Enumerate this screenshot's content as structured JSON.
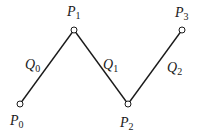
{
  "diagram": {
    "type": "polyline",
    "stroke_color": "#1a1a1a",
    "points": [
      {
        "id": "P0",
        "name": "P",
        "sub": "0",
        "x": 20,
        "y": 104,
        "lx": 10,
        "ly": 125
      },
      {
        "id": "P1",
        "name": "P",
        "sub": "1",
        "x": 74,
        "y": 30,
        "lx": 67,
        "ly": 16
      },
      {
        "id": "P2",
        "name": "P",
        "sub": "2",
        "x": 128,
        "y": 104,
        "lx": 120,
        "ly": 127
      },
      {
        "id": "P3",
        "name": "P",
        "sub": "3",
        "x": 182,
        "y": 30,
        "lx": 175,
        "ly": 17
      }
    ],
    "segments": [
      {
        "id": "Q0",
        "name": "Q",
        "sub": "0",
        "lx": 25,
        "ly": 69
      },
      {
        "id": "Q1",
        "name": "Q",
        "sub": "1",
        "lx": 103,
        "ly": 69
      },
      {
        "id": "Q2",
        "name": "Q",
        "sub": "2",
        "lx": 167,
        "ly": 72
      }
    ]
  }
}
